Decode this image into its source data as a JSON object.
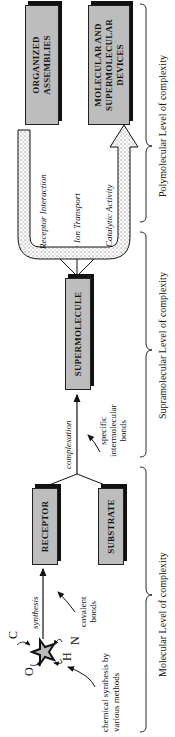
{
  "diagram": {
    "levels": [
      {
        "label": "Molecular Level of complexity"
      },
      {
        "label": "Supramolecular Level of complexity"
      },
      {
        "label": "Polymolecular Level of complexity"
      }
    ],
    "atoms": [
      "C",
      "O",
      "H",
      "N"
    ],
    "notes": {
      "chemical_synthesis": [
        "chemical synthesis by",
        "various methods"
      ],
      "synthesis": "synthesis",
      "covalent_bonds": [
        "covalent",
        "bonds"
      ],
      "complexation": "complexation",
      "intermolecular_bonds": [
        "specific",
        "intermolecular",
        "bonds"
      ]
    },
    "boxes": {
      "receptor": "RECEPTOR",
      "substrate": "SUBSTRATE",
      "supermolecule": "SUPERMOLECULE",
      "organized_assemblies": [
        "ORGANIZED",
        "ASSEMBLIES"
      ],
      "devices": [
        "MOLECULAR AND",
        "SUPERMOLECULAR",
        "DEVICES"
      ]
    },
    "functions": [
      "Receptor Interaction",
      "Ion Transport",
      "Catalytic Activity"
    ]
  }
}
